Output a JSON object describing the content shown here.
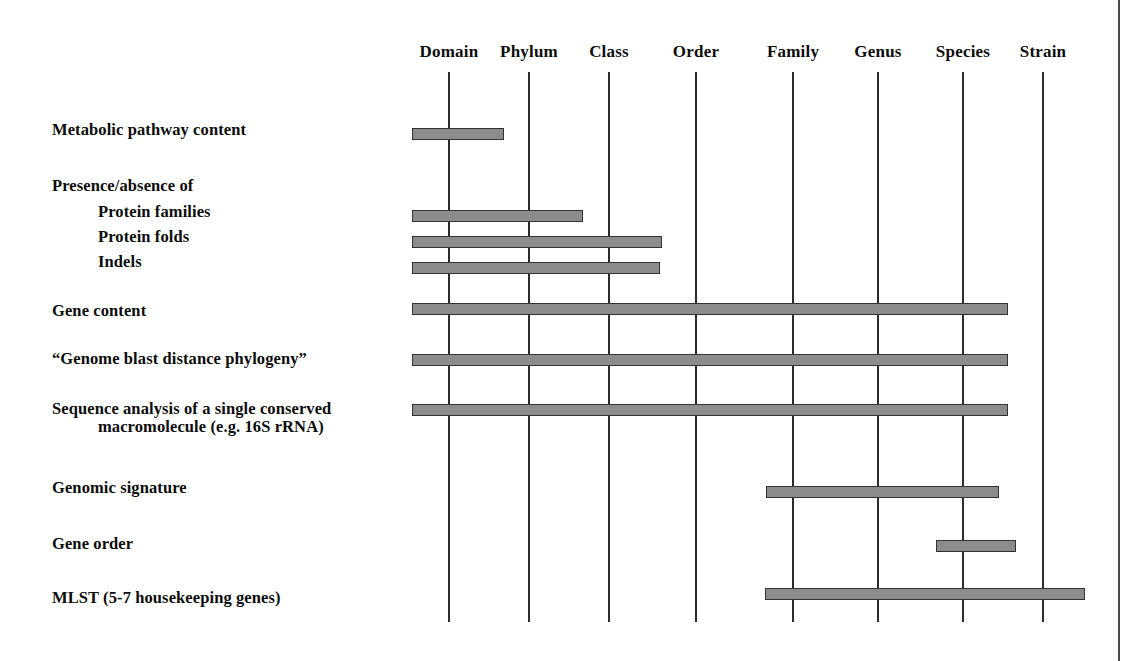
{
  "figure": {
    "type": "resolution-range-diagram",
    "axis": {
      "name": "taxonomic-rank-axis",
      "ranks": [
        {
          "label": "Domain",
          "x": 449
        },
        {
          "label": "Phylum",
          "x": 529
        },
        {
          "label": "Class",
          "x": 609
        },
        {
          "label": "Order",
          "x": 696
        },
        {
          "label": "Family",
          "x": 793
        },
        {
          "label": "Genus",
          "x": 878
        },
        {
          "label": "Species",
          "x": 963
        },
        {
          "label": "Strain",
          "x": 1043
        }
      ],
      "line_top": 72,
      "line_bottom": 622
    },
    "rows": [
      {
        "id": "metabolic-pathway-content",
        "label": "Metabolic pathway content",
        "label_x": 52,
        "label_y": 121,
        "lines": [
          "Metabolic pathway content"
        ],
        "bar": {
          "x": 412,
          "y": 128,
          "width": 92,
          "from_rank": "Domain",
          "to_rank": "Phylum"
        }
      },
      {
        "id": "presence-absence-heading",
        "label": "Presence/absence of",
        "label_x": 52,
        "label_y": 177,
        "lines": [
          "Presence/absence of"
        ],
        "bar": null
      },
      {
        "id": "protein-families",
        "label": "Protein families",
        "label_x": 98,
        "label_y": 203,
        "lines": [
          "Protein families"
        ],
        "bar": {
          "x": 412,
          "y": 210,
          "width": 171,
          "from_rank": "Domain",
          "to_rank": "Class"
        }
      },
      {
        "id": "protein-folds",
        "label": "Protein folds",
        "label_x": 98,
        "label_y": 228,
        "lines": [
          "Protein folds"
        ],
        "bar": {
          "x": 412,
          "y": 236,
          "width": 250,
          "from_rank": "Domain",
          "to_rank": "Order"
        }
      },
      {
        "id": "indels",
        "label": "Indels",
        "label_x": 98,
        "label_y": 253,
        "lines": [
          "Indels"
        ],
        "bar": {
          "x": 412,
          "y": 262,
          "width": 248,
          "from_rank": "Domain",
          "to_rank": "Order"
        }
      },
      {
        "id": "gene-content",
        "label": "Gene content",
        "label_x": 52,
        "label_y": 302,
        "lines": [
          "Gene content"
        ],
        "bar": {
          "x": 412,
          "y": 303,
          "width": 596,
          "from_rank": "Domain",
          "to_rank": "Species"
        }
      },
      {
        "id": "genome-blast-distance-phylogeny",
        "label": "“Genome blast distance phylogeny”",
        "label_x": 52,
        "label_y": 350,
        "lines": [
          "“Genome blast distance phylogeny”"
        ],
        "bar": {
          "x": 412,
          "y": 354,
          "width": 596,
          "from_rank": "Domain",
          "to_rank": "Species"
        }
      },
      {
        "id": "sequence-analysis-single-conserved-macromolecule",
        "label": "Sequence analysis of a single conserved macromolecule (e.g. 16S rRNA)",
        "label_x": 52,
        "label_y": 400,
        "lines": [
          "Sequence analysis of a single conserved",
          "macromolecule (e.g. 16S rRNA)"
        ],
        "bar": {
          "x": 412,
          "y": 404,
          "width": 596,
          "from_rank": "Domain",
          "to_rank": "Species"
        }
      },
      {
        "id": "genomic-signature",
        "label": "Genomic signature",
        "label_x": 52,
        "label_y": 479,
        "lines": [
          "Genomic signature"
        ],
        "bar": {
          "x": 766,
          "y": 486,
          "width": 233,
          "from_rank": "Family",
          "to_rank": "Species"
        }
      },
      {
        "id": "gene-order",
        "label": "Gene order",
        "label_x": 52,
        "label_y": 535,
        "lines": [
          "Gene order"
        ],
        "bar": {
          "x": 936,
          "y": 540,
          "width": 80,
          "from_rank": "Genus",
          "to_rank": "Species"
        }
      },
      {
        "id": "mlst-housekeeping-genes",
        "label": "MLST (5-7 housekeeping genes)",
        "label_x": 52,
        "label_y": 589,
        "lines": [
          "MLST (5-7 housekeeping genes)"
        ],
        "bar": {
          "x": 765,
          "y": 588,
          "width": 320,
          "from_rank": "Family",
          "to_rank": "Strain"
        }
      }
    ],
    "colors": {
      "bar_fill": "#8c8c8c",
      "bar_stroke": "#333333",
      "gridline": "#2b2b2b",
      "text": "#0d0d0d",
      "page_border": "#4a4a4a",
      "background": "#ffffff"
    },
    "page_border_right_x": 1118
  }
}
